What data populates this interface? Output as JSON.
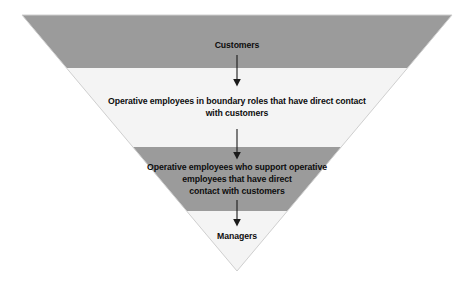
{
  "diagram": {
    "name": "inverted-service-pyramid",
    "shape": "inverted-triangle",
    "geometry": {
      "top_left_x": 22,
      "top_right_x": 452,
      "top_y": 15,
      "apex_x": 237,
      "apex_y": 271
    },
    "colors": {
      "band_dark": "#9b9b9b",
      "band_light": "#f4f4f4",
      "outline": "#c9c9c9",
      "text": "#0d0d0d",
      "arrow": "#1a1a1a",
      "background": "#ffffff"
    },
    "bands": [
      {
        "id": "band-customers",
        "fill": "dark",
        "y_top": 15,
        "y_bottom": 68
      },
      {
        "id": "band-boundary-employees",
        "fill": "light",
        "y_top": 68,
        "y_bottom": 147
      },
      {
        "id": "band-support-employees",
        "fill": "dark",
        "y_top": 147,
        "y_bottom": 211
      },
      {
        "id": "band-managers",
        "fill": "light",
        "y_top": 211,
        "y_bottom": 271
      }
    ],
    "labels": [
      {
        "id": "customers",
        "text": "Customers"
      },
      {
        "id": "boundary-employees",
        "text": "Operative employees in boundary roles that have direct contact\nwith customers"
      },
      {
        "id": "support-employees",
        "text": "Operative employees who support operative\nemployees that have direct\ncontact with customers"
      },
      {
        "id": "managers",
        "text": "Managers"
      }
    ],
    "arrows": [
      {
        "id": "arrow-customers-to-boundary",
        "x": 237,
        "y_start": 55,
        "y_end": 86,
        "direction": "down"
      },
      {
        "id": "arrow-boundary-to-support",
        "x": 237,
        "y_start": 129,
        "y_end": 159,
        "direction": "down"
      },
      {
        "id": "arrow-support-to-managers",
        "x": 237,
        "y_start": 200,
        "y_end": 226,
        "direction": "down"
      }
    ]
  }
}
